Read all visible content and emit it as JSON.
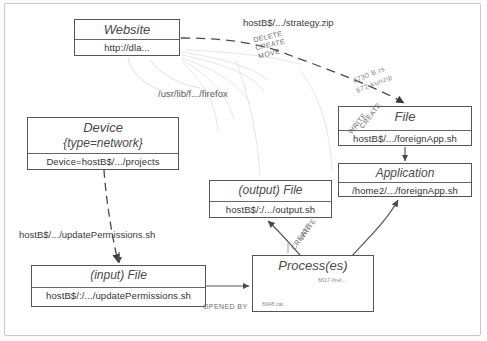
{
  "diagram": {
    "nodes": [
      {
        "id": "website",
        "type": "Website",
        "label": "http://dla...",
        "x": 74,
        "y": 19,
        "w": 106,
        "h": 37
      },
      {
        "id": "device",
        "type": "Device",
        "attr": "{type=network}",
        "label": "Device=hostB$/.../projects",
        "x": 27,
        "y": 117,
        "w": 152,
        "h": 53
      },
      {
        "id": "file",
        "type": "File",
        "label": "hostB$/.../foreignApp.sh",
        "x": 338,
        "y": 106,
        "w": 134,
        "h": 40
      },
      {
        "id": "application",
        "type": "Application",
        "label": "/home2/.../foreignApp.sh",
        "x": 338,
        "y": 163,
        "w": 134,
        "h": 34
      },
      {
        "id": "output-file",
        "type": "(output) File",
        "label": "hostB$/:/.../output.sh",
        "x": 209,
        "y": 180,
        "w": 123,
        "h": 38
      },
      {
        "id": "process",
        "type": "Process(es)",
        "label": "",
        "x": 252,
        "y": 255,
        "w": 122,
        "h": 57
      },
      {
        "id": "input-file",
        "type": "(input) File",
        "label": "hostB$/:/.../updatePermissions.sh",
        "x": 31,
        "y": 265,
        "w": 175,
        "h": 42
      }
    ],
    "edge_labels": [
      {
        "id": "strategy",
        "text": "hostB$/.../strategy.zip",
        "x": 243,
        "y": 17
      },
      {
        "id": "firefox",
        "text": "/usr/lib/f.../firefox",
        "x": 158,
        "y": 88
      },
      {
        "id": "updatepermissions",
        "text": "hostB$/.../updatePermissions.sh",
        "x": 19,
        "y": 229
      }
    ],
    "edge_verbs": [
      {
        "id": "delete",
        "text": "DELETE",
        "x": 253,
        "y": 33,
        "rot": -13
      },
      {
        "id": "create-top",
        "text": "CREATE",
        "x": 255,
        "y": 41,
        "rot": -13
      },
      {
        "id": "move",
        "text": "MOVE",
        "x": 258,
        "y": 50,
        "rot": -13
      },
      {
        "id": "create-file",
        "text": "CREATE",
        "x": 355,
        "y": 112,
        "rot": -52
      },
      {
        "id": "write-file",
        "text": "WRITE",
        "x": 348,
        "y": 119,
        "rot": -52
      },
      {
        "id": "write-out",
        "text": "WRITE",
        "x": 295,
        "y": 226,
        "rot": -56
      },
      {
        "id": "create-out",
        "text": "CREATE",
        "x": 287,
        "y": 233,
        "rot": -56
      },
      {
        "id": "opened-by",
        "text": "OPENED BY",
        "x": 203,
        "y": 303,
        "rot": 0
      },
      {
        "id": "appzip",
        "text": "672-kunzip",
        "x": 357,
        "y": 80,
        "rot": -22
      },
      {
        "id": "appzip2",
        "text": "6730 B.rs",
        "x": 355,
        "y": 72,
        "rot": -22
      }
    ],
    "process_entries": [
      {
        "id": "pid-firefox",
        "text": "6617-firef...",
        "x": 318,
        "y": 277
      },
      {
        "id": "pid-cat",
        "text": "6948 cat",
        "x": 262,
        "y": 301
      }
    ],
    "colors": {
      "node_border": "#555555",
      "node_text": "#4a4a4a",
      "edge": "#555555",
      "frame": "#c9c9c9",
      "background": "#ffffff"
    }
  }
}
